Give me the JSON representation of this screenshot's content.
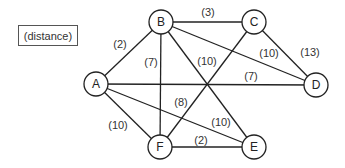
{
  "legend": {
    "label": "(distance)"
  },
  "nodes": [
    {
      "id": "A",
      "x": 96,
      "y": 84
    },
    {
      "id": "B",
      "x": 161,
      "y": 22
    },
    {
      "id": "C",
      "x": 254,
      "y": 22
    },
    {
      "id": "D",
      "x": 316,
      "y": 85
    },
    {
      "id": "F",
      "x": 160,
      "y": 147
    },
    {
      "id": "E",
      "x": 254,
      "y": 147
    }
  ],
  "node_radius": 12,
  "edges": [
    {
      "from": "A",
      "to": "B",
      "weight": "(2)",
      "lx": 120,
      "ly": 44
    },
    {
      "from": "B",
      "to": "C",
      "weight": "(3)",
      "lx": 208,
      "ly": 12
    },
    {
      "from": "C",
      "to": "D",
      "weight": "(13)",
      "lx": 310,
      "ly": 52
    },
    {
      "from": "B",
      "to": "D",
      "weight": "(10)",
      "lx": 269,
      "ly": 53
    },
    {
      "from": "A",
      "to": "D",
      "weight": "(7)",
      "lx": 251,
      "ly": 76
    },
    {
      "from": "B",
      "to": "F",
      "weight": "(7)",
      "lx": 151,
      "ly": 62
    },
    {
      "from": "B",
      "to": "E",
      "weight": "(10)",
      "lx": 207,
      "ly": 61
    },
    {
      "from": "C",
      "to": "F",
      "weight": "(8)",
      "lx": 181,
      "ly": 102
    },
    {
      "from": "A",
      "to": "F",
      "weight": "(10)",
      "lx": 118,
      "ly": 125
    },
    {
      "from": "A",
      "to": "E",
      "weight": "(10)",
      "lx": 221,
      "ly": 122
    },
    {
      "from": "F",
      "to": "E",
      "weight": "(2)",
      "lx": 201,
      "ly": 140
    }
  ]
}
